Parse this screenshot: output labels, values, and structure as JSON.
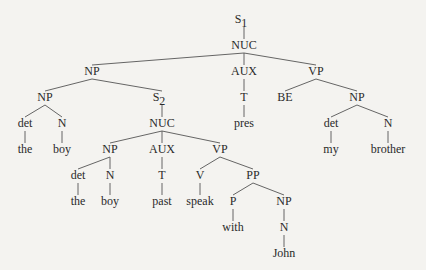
{
  "diagram": {
    "type": "syntax-tree",
    "nodes": [
      {
        "id": "s1",
        "label": "S",
        "sub": "1"
      },
      {
        "id": "nuc1",
        "label": "NUC"
      },
      {
        "id": "np1",
        "label": "NP"
      },
      {
        "id": "aux1",
        "label": "AUX"
      },
      {
        "id": "vp1",
        "label": "VP"
      },
      {
        "id": "np2",
        "label": "NP"
      },
      {
        "id": "s2",
        "label": "S",
        "sub": "2"
      },
      {
        "id": "t1",
        "label": "T"
      },
      {
        "id": "be",
        "label": "BE"
      },
      {
        "id": "np3",
        "label": "NP"
      },
      {
        "id": "det1",
        "label": "det"
      },
      {
        "id": "n1",
        "label": "N"
      },
      {
        "id": "nuc2",
        "label": "NUC"
      },
      {
        "id": "pres",
        "label": "pres"
      },
      {
        "id": "det3",
        "label": "det"
      },
      {
        "id": "n3",
        "label": "N"
      },
      {
        "id": "the1",
        "label": "the"
      },
      {
        "id": "boy1",
        "label": "boy"
      },
      {
        "id": "np4",
        "label": "NP"
      },
      {
        "id": "aux2",
        "label": "AUX"
      },
      {
        "id": "vp2",
        "label": "VP"
      },
      {
        "id": "my",
        "label": "my"
      },
      {
        "id": "brother",
        "label": "brother"
      },
      {
        "id": "det2",
        "label": "det"
      },
      {
        "id": "n2",
        "label": "N"
      },
      {
        "id": "t2",
        "label": "T"
      },
      {
        "id": "v",
        "label": "V"
      },
      {
        "id": "pp",
        "label": "PP"
      },
      {
        "id": "the2",
        "label": "the"
      },
      {
        "id": "boy2",
        "label": "boy"
      },
      {
        "id": "past",
        "label": "past"
      },
      {
        "id": "speak",
        "label": "speak"
      },
      {
        "id": "p",
        "label": "P"
      },
      {
        "id": "np5",
        "label": "NP"
      },
      {
        "id": "with",
        "label": "with"
      },
      {
        "id": "n4",
        "label": "N"
      },
      {
        "id": "john",
        "label": "John"
      }
    ],
    "edges": [
      [
        "s1",
        "nuc1"
      ],
      [
        "nuc1",
        "np1"
      ],
      [
        "nuc1",
        "aux1"
      ],
      [
        "nuc1",
        "vp1"
      ],
      [
        "np1",
        "np2"
      ],
      [
        "np1",
        "s2"
      ],
      [
        "aux1",
        "t1"
      ],
      [
        "vp1",
        "be"
      ],
      [
        "vp1",
        "np3"
      ],
      [
        "np2",
        "det1"
      ],
      [
        "np2",
        "n1"
      ],
      [
        "s2",
        "nuc2"
      ],
      [
        "t1",
        "pres"
      ],
      [
        "np3",
        "det3"
      ],
      [
        "np3",
        "n3"
      ],
      [
        "det1",
        "the1"
      ],
      [
        "n1",
        "boy1"
      ],
      [
        "nuc2",
        "np4"
      ],
      [
        "nuc2",
        "aux2"
      ],
      [
        "nuc2",
        "vp2"
      ],
      [
        "det3",
        "my"
      ],
      [
        "n3",
        "brother"
      ],
      [
        "np4",
        "det2"
      ],
      [
        "np4",
        "n2"
      ],
      [
        "aux2",
        "t2"
      ],
      [
        "vp2",
        "v"
      ],
      [
        "vp2",
        "pp"
      ],
      [
        "det2",
        "the2"
      ],
      [
        "n2",
        "boy2"
      ],
      [
        "t2",
        "past"
      ],
      [
        "v",
        "speak"
      ],
      [
        "pp",
        "p"
      ],
      [
        "pp",
        "np5"
      ],
      [
        "p",
        "with"
      ],
      [
        "np5",
        "n4"
      ],
      [
        "n4",
        "john"
      ]
    ]
  }
}
